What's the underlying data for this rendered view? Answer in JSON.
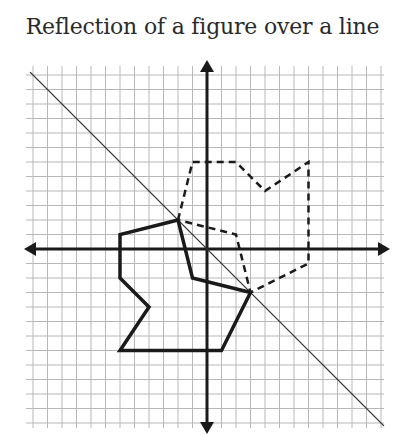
{
  "title": "Reflection of a figure over a line",
  "colors": {
    "grid": "#b8b8b8",
    "axes": "#1a1a1a",
    "figure": "#1a1a1a",
    "reflection_line": "#333333"
  },
  "grid": {
    "origin_px": [
      207,
      249
    ],
    "unit_px": 14.5,
    "x_range": [
      -12,
      12
    ],
    "y_range": [
      -12,
      12
    ]
  },
  "reflection_line": {
    "equation": "y = -x"
  },
  "original_figure": {
    "style": "solid",
    "vertices": [
      [
        -2,
        2
      ],
      [
        -6,
        1
      ],
      [
        -6,
        -2
      ],
      [
        -4,
        -4
      ],
      [
        -6,
        -7
      ],
      [
        1,
        -7
      ],
      [
        3,
        -3
      ],
      [
        -1,
        -2
      ]
    ]
  },
  "reflected_figure": {
    "style": "dashed",
    "vertices": [
      [
        -2,
        2
      ],
      [
        -1,
        6
      ],
      [
        2,
        6
      ],
      [
        4,
        4
      ],
      [
        7,
        6
      ],
      [
        7,
        -1
      ],
      [
        3,
        -3
      ],
      [
        2,
        1
      ]
    ]
  }
}
